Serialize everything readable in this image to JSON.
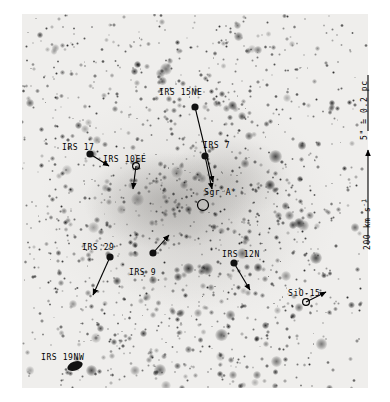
{
  "figure": {
    "kind": "galactic-center-proper-motion-map",
    "background_color": "#efeeec",
    "ink_color": "#000000"
  },
  "scale_legend": {
    "angular_scale_label": "5\" = 0.2 pc",
    "velocity_scale_label": "200 km s",
    "velocity_scale_exponent": "-1",
    "velocity_arrow_direction": "up"
  },
  "sources": [
    {
      "id": "irs-15ne",
      "label": "IRS 15NE",
      "marker": "filled-dot",
      "x": 195,
      "y": 107,
      "label_x": 159,
      "label_y": 88,
      "vector_dx": 18,
      "vector_dy": 75
    },
    {
      "id": "irs-7",
      "label": "IRS 7",
      "marker": "filled-dot",
      "x": 205,
      "y": 156,
      "label_x": 203,
      "label_y": 141,
      "vector_dx": 7,
      "vector_dy": 33
    },
    {
      "id": "irs-17",
      "label": "IRS 17",
      "marker": "filled-dot",
      "x": 90,
      "y": 154,
      "label_x": 62,
      "label_y": 143,
      "vector_dx": 19,
      "vector_dy": 12
    },
    {
      "id": "irs-10ee",
      "label": "IRS 10EE",
      "marker": "open-circle",
      "x": 136,
      "y": 166,
      "label_x": 103,
      "label_y": 155,
      "vector_dx": -3,
      "vector_dy": 23
    },
    {
      "id": "sgr-a-star",
      "label": "Sgr A*",
      "marker": "open-circle-large",
      "x": 203,
      "y": 205,
      "label_x": 204,
      "label_y": 188,
      "vector_dx": 0,
      "vector_dy": 0
    },
    {
      "id": "irs-29",
      "label": "IRS 29",
      "marker": "filled-dot",
      "x": 110,
      "y": 257,
      "label_x": 82,
      "label_y": 243,
      "vector_dx": -17,
      "vector_dy": 38
    },
    {
      "id": "irs-9",
      "label": "IRS 9",
      "marker": "filled-dot",
      "x": 153,
      "y": 253,
      "label_x": 129,
      "label_y": 268,
      "vector_dx": 16,
      "vector_dy": -18
    },
    {
      "id": "irs-12n",
      "label": "IRS 12N",
      "marker": "filled-dot",
      "x": 234,
      "y": 263,
      "label_x": 222,
      "label_y": 250,
      "vector_dx": 16,
      "vector_dy": 27
    },
    {
      "id": "sio-15",
      "label": "SiO-15",
      "marker": "open-circle",
      "x": 306,
      "y": 302,
      "label_x": 288,
      "label_y": 289,
      "vector_dx": 20,
      "vector_dy": -10
    },
    {
      "id": "irs-19nw",
      "label": "IRS 19NW",
      "marker": "filled-blob",
      "x": 75,
      "y": 366,
      "label_x": 41,
      "label_y": 353,
      "vector_dx": 0,
      "vector_dy": 0
    }
  ]
}
